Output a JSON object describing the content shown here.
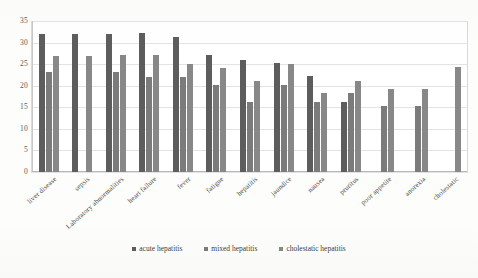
{
  "chart_data": {
    "type": "bar",
    "title": "",
    "subtitle": "",
    "xlabel": "",
    "ylabel": "",
    "ylim": [
      0,
      35
    ],
    "yticks": [
      0,
      5,
      10,
      15,
      20,
      25,
      30,
      35
    ],
    "grid": true,
    "legend_position": "bottom",
    "categories": [
      "liver disease",
      "sepsis",
      "Laboratory abnormalities",
      "heart failure",
      "fever",
      "fatigue",
      "hepatitis",
      "jaundice",
      "nausea",
      "pruritus",
      "poor appetite",
      "anorexia",
      "cholestatic"
    ],
    "series": [
      {
        "name": "acute hepatitis",
        "color": "#5d5d5d",
        "values": [
          32.1,
          32.1,
          32.1,
          32.2,
          31.2,
          27.1,
          26.0,
          25.2,
          22.2,
          16.3,
          0,
          0,
          0
        ]
      },
      {
        "name": "mixed hepatitis",
        "color": "#7b7b7b",
        "values": [
          23.1,
          0,
          23.1,
          22.0,
          22.0,
          20.2,
          16.2,
          20.2,
          16.3,
          18.3,
          15.3,
          15.3,
          0
        ]
      },
      {
        "name": "cholestatic hepatitis",
        "color": "#888888",
        "values": [
          27.0,
          27.0,
          27.1,
          27.1,
          25.1,
          24.1,
          21.1,
          25.1,
          18.2,
          21.2,
          19.3,
          19.3,
          24.4
        ]
      }
    ]
  },
  "legend": {
    "items": [
      {
        "label": "acute hepatitis"
      },
      {
        "label": "mixed hepatitis"
      },
      {
        "label": "cholestatic hepatitis"
      }
    ]
  }
}
